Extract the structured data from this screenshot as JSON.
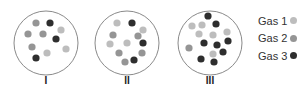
{
  "colors": {
    "gas1": "#bdbdbd",
    "gas2": "#959595",
    "gas3": "#2e2e2e",
    "circle_stroke": "#8a8a8a"
  },
  "containers": [
    {
      "label": "I",
      "cx": 46,
      "cy": 43,
      "r": 32,
      "particles": [
        {
          "x": 36,
          "y": 23,
          "gas": 2
        },
        {
          "x": 50,
          "y": 23,
          "gas": 3
        },
        {
          "x": 61,
          "y": 30,
          "gas": 1
        },
        {
          "x": 28,
          "y": 34,
          "gas": 2
        },
        {
          "x": 43,
          "y": 34,
          "gas": 2
        },
        {
          "x": 56,
          "y": 39,
          "gas": 3
        },
        {
          "x": 32,
          "y": 47,
          "gas": 2
        },
        {
          "x": 47,
          "y": 53,
          "gas": 1
        },
        {
          "x": 66,
          "y": 49,
          "gas": 1
        },
        {
          "x": 36,
          "y": 58,
          "gas": 3
        }
      ]
    },
    {
      "label": "II",
      "cx": 127,
      "cy": 43,
      "r": 32,
      "particles": [
        {
          "x": 117,
          "y": 23,
          "gas": 1
        },
        {
          "x": 132,
          "y": 23,
          "gas": 3
        },
        {
          "x": 143,
          "y": 30,
          "gas": 1
        },
        {
          "x": 113,
          "y": 35,
          "gas": 2
        },
        {
          "x": 138,
          "y": 36,
          "gas": 2
        },
        {
          "x": 110,
          "y": 44,
          "gas": 1
        },
        {
          "x": 127,
          "y": 43,
          "gas": 1
        },
        {
          "x": 143,
          "y": 43,
          "gas": 3
        },
        {
          "x": 119,
          "y": 53,
          "gas": 2
        },
        {
          "x": 142,
          "y": 53,
          "gas": 2
        },
        {
          "x": 125,
          "y": 62,
          "gas": 2
        },
        {
          "x": 134,
          "y": 60,
          "gas": 3
        }
      ]
    },
    {
      "label": "III",
      "cx": 210,
      "cy": 43,
      "r": 32,
      "particles": [
        {
          "x": 208,
          "y": 16,
          "gas": 3
        },
        {
          "x": 192,
          "y": 26,
          "gas": 1
        },
        {
          "x": 202,
          "y": 25,
          "gas": 1
        },
        {
          "x": 216,
          "y": 24,
          "gas": 3
        },
        {
          "x": 199,
          "y": 34,
          "gas": 1
        },
        {
          "x": 213,
          "y": 35,
          "gas": 1
        },
        {
          "x": 227,
          "y": 32,
          "gas": 1
        },
        {
          "x": 228,
          "y": 41,
          "gas": 3
        },
        {
          "x": 204,
          "y": 43,
          "gas": 3
        },
        {
          "x": 217,
          "y": 45,
          "gas": 3
        },
        {
          "x": 189,
          "y": 48,
          "gas": 2
        },
        {
          "x": 223,
          "y": 52,
          "gas": 3
        },
        {
          "x": 213,
          "y": 54,
          "gas": 1
        },
        {
          "x": 201,
          "y": 59,
          "gas": 3
        },
        {
          "x": 214,
          "y": 62,
          "gas": 3
        }
      ]
    }
  ],
  "legend": [
    {
      "label": "Gas 1",
      "gas": 1
    },
    {
      "label": "Gas 2",
      "gas": 2
    },
    {
      "label": "Gas 3",
      "gas": 3
    }
  ]
}
